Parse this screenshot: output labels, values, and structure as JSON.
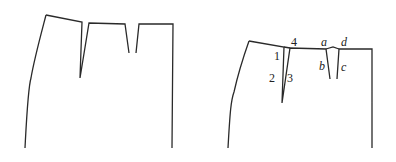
{
  "figure": {
    "left_panel": {
      "description": "Skirt front pattern with two waist darts"
    },
    "right_panel": {
      "description": "Skirt pattern with darts labeled",
      "dart1_labels": [
        "1",
        "2",
        "3",
        "4"
      ],
      "dart2_labels": [
        "a",
        "b",
        "c",
        "d"
      ]
    }
  },
  "labels": {
    "n1": "1",
    "n2": "2",
    "n3": "3",
    "n4": "4",
    "a": "a",
    "b": "b",
    "c": "c",
    "d": "d"
  },
  "colors": {
    "stroke": "#2a2a2a",
    "background": "#ffffff"
  }
}
